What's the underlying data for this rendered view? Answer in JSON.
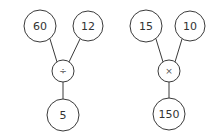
{
  "diagrams": [
    {
      "name": "division-tree",
      "inputs": [
        {
          "label": "60",
          "cx": 40,
          "cy": 26,
          "r": 16
        },
        {
          "label": "12",
          "cx": 88,
          "cy": 26,
          "r": 15
        }
      ],
      "operator": {
        "label": "÷",
        "cx": 63,
        "cy": 71,
        "r": 11
      },
      "result": {
        "label": "5",
        "cx": 63,
        "cy": 115,
        "r": 16
      }
    },
    {
      "name": "multiplication-tree",
      "inputs": [
        {
          "label": "15",
          "cx": 146,
          "cy": 26,
          "r": 16
        },
        {
          "label": "10",
          "cx": 190,
          "cy": 26,
          "r": 15
        }
      ],
      "operator": {
        "label": "×",
        "cx": 169,
        "cy": 71,
        "r": 11
      },
      "result": {
        "label": "150",
        "cx": 169,
        "cy": 114,
        "r": 16
      }
    }
  ],
  "colors": {
    "stroke": "#3a3a3a",
    "text": "#333333",
    "background": "#ffffff"
  }
}
